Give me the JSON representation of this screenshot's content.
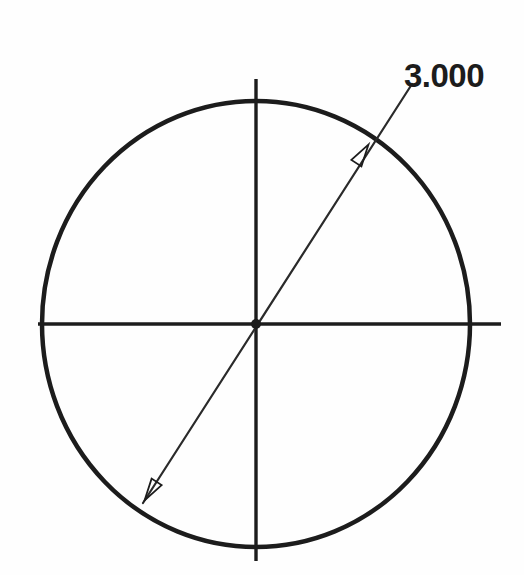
{
  "drawing": {
    "type": "diameter-dimension-sketch",
    "background_color": "#fefefe",
    "line_color": "#1c1c1c",
    "dimension": {
      "label": "3.000",
      "value": 3.0,
      "kind": "diameter",
      "text_x": 404,
      "text_y": 57,
      "font_size_px": 33
    },
    "circle": {
      "name": "main-circle",
      "center_x": 256,
      "center_y": 324,
      "radius_x": 214,
      "radius_y": 223,
      "stroke_width": 4.5,
      "stroke_color": "#1c1c1c"
    },
    "center_mark": {
      "name": "center-point",
      "x": 256,
      "y": 324,
      "radius": 5,
      "color": "#1c1c1c"
    },
    "centerlines": [
      {
        "name": "horizontal-centerline",
        "x1": 38,
        "y1": 324,
        "x2": 501,
        "y2": 324,
        "stroke_width": 3.4
      },
      {
        "name": "vertical-centerline",
        "x1": 256,
        "y1": 79,
        "x2": 256,
        "y2": 561,
        "stroke_width": 3.4
      }
    ],
    "dimension_line": {
      "name": "diameter-dimension-line",
      "x1": 143,
      "y1": 503,
      "x2": 412,
      "y2": 84,
      "stroke_width": 2.2,
      "stroke_color": "#2a2a2a"
    },
    "arrowheads": [
      {
        "name": "upper-arrowhead",
        "x": 363,
        "y": 153,
        "angle_deg": -57,
        "style": "open-outline",
        "length": 22,
        "half_width": 6
      },
      {
        "name": "lower-arrowhead",
        "x": 150,
        "y": 492,
        "angle_deg": 123,
        "style": "open-outline",
        "length": 22,
        "half_width": 6
      }
    ]
  }
}
